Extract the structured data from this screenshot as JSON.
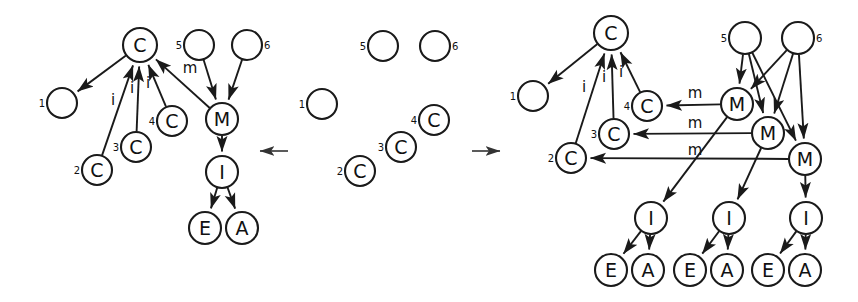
{
  "figure": {
    "background": "#ffffff",
    "stroke_color": "#1a1a1a",
    "width": 858,
    "height": 302
  },
  "transitions": [
    {
      "name": "left-transition-arrow",
      "glyph": "←",
      "direction": "left",
      "x": 274,
      "y": 151
    },
    {
      "name": "right-transition-arrow",
      "glyph": "→",
      "direction": "right",
      "x": 486,
      "y": 151
    }
  ],
  "panels": [
    {
      "id": "left-panel",
      "name": "left-graph",
      "nodes": [
        {
          "id": "L-C0",
          "label": "C",
          "index": "",
          "x": 140,
          "y": 45,
          "r": 17,
          "index_side": "none"
        },
        {
          "id": "L-1",
          "label": "",
          "index": "1",
          "x": 62,
          "y": 103,
          "r": 15,
          "index_side": "left"
        },
        {
          "id": "L-2",
          "label": "C",
          "index": "2",
          "x": 97,
          "y": 170,
          "r": 15,
          "index_side": "left"
        },
        {
          "id": "L-3",
          "label": "C",
          "index": "3",
          "x": 136,
          "y": 147,
          "r": 15,
          "index_side": "left"
        },
        {
          "id": "L-4",
          "label": "C",
          "index": "4",
          "x": 172,
          "y": 121,
          "r": 15,
          "index_side": "left"
        },
        {
          "id": "L-5",
          "label": "",
          "index": "5",
          "x": 199,
          "y": 45,
          "r": 15,
          "index_side": "left"
        },
        {
          "id": "L-6",
          "label": "",
          "index": "6",
          "x": 247,
          "y": 45,
          "r": 15,
          "index_side": "right"
        },
        {
          "id": "L-M",
          "label": "M",
          "index": "",
          "x": 222,
          "y": 119,
          "r": 16,
          "index_side": "none"
        },
        {
          "id": "L-I",
          "label": "I",
          "index": "",
          "x": 222,
          "y": 172,
          "r": 16,
          "index_side": "none"
        },
        {
          "id": "L-E",
          "label": "E",
          "index": "",
          "x": 205,
          "y": 228,
          "r": 16,
          "index_side": "none"
        },
        {
          "id": "L-A",
          "label": "A",
          "index": "",
          "x": 242,
          "y": 228,
          "r": 16,
          "index_side": "none"
        }
      ],
      "edges": [
        {
          "from": "L-C0",
          "to": "L-1",
          "label": "",
          "lx": 0,
          "ly": 0
        },
        {
          "from": "L-2",
          "to": "L-C0",
          "label": "i",
          "lx": 113,
          "ly": 105
        },
        {
          "from": "L-3",
          "to": "L-C0",
          "label": "i",
          "lx": 132,
          "ly": 93
        },
        {
          "from": "L-4",
          "to": "L-C0",
          "label": "i",
          "lx": 148,
          "ly": 88
        },
        {
          "from": "L-M",
          "to": "L-C0",
          "label": "m",
          "lx": 190,
          "ly": 73
        },
        {
          "from": "L-5",
          "to": "L-M",
          "label": "",
          "lx": 0,
          "ly": 0
        },
        {
          "from": "L-6",
          "to": "L-M",
          "label": "",
          "lx": 0,
          "ly": 0
        },
        {
          "from": "L-M",
          "to": "L-I",
          "label": "",
          "lx": 0,
          "ly": 0
        },
        {
          "from": "L-I",
          "to": "L-E",
          "label": "",
          "lx": 0,
          "ly": 0
        },
        {
          "from": "L-I",
          "to": "L-A",
          "label": "",
          "lx": 0,
          "ly": 0
        }
      ]
    },
    {
      "id": "middle-panel",
      "name": "middle-graph",
      "nodes": [
        {
          "id": "M-1",
          "label": "",
          "index": "1",
          "x": 322,
          "y": 104,
          "r": 15,
          "index_side": "left"
        },
        {
          "id": "M-2",
          "label": "C",
          "index": "2",
          "x": 360,
          "y": 171,
          "r": 15,
          "index_side": "left"
        },
        {
          "id": "M-3",
          "label": "C",
          "index": "3",
          "x": 401,
          "y": 147,
          "r": 15,
          "index_side": "left"
        },
        {
          "id": "M-4",
          "label": "C",
          "index": "4",
          "x": 434,
          "y": 120,
          "r": 15,
          "index_side": "left"
        },
        {
          "id": "M-5",
          "label": "",
          "index": "5",
          "x": 383,
          "y": 46,
          "r": 15,
          "index_side": "left"
        },
        {
          "id": "M-6",
          "label": "",
          "index": "6",
          "x": 435,
          "y": 46,
          "r": 15,
          "index_side": "right"
        }
      ],
      "edges": []
    },
    {
      "id": "right-panel",
      "name": "right-graph",
      "nodes": [
        {
          "id": "R-C0",
          "label": "C",
          "index": "",
          "x": 611,
          "y": 33,
          "r": 17,
          "index_side": "none"
        },
        {
          "id": "R-1",
          "label": "",
          "index": "1",
          "x": 533,
          "y": 96,
          "r": 15,
          "index_side": "left"
        },
        {
          "id": "R-2",
          "label": "C",
          "index": "2",
          "x": 571,
          "y": 158,
          "r": 15,
          "index_side": "left"
        },
        {
          "id": "R-3",
          "label": "C",
          "index": "3",
          "x": 614,
          "y": 134,
          "r": 15,
          "index_side": "left"
        },
        {
          "id": "R-4",
          "label": "C",
          "index": "4",
          "x": 647,
          "y": 106,
          "r": 15,
          "index_side": "left"
        },
        {
          "id": "R-5",
          "label": "",
          "index": "5",
          "x": 745,
          "y": 38,
          "r": 16,
          "index_side": "left"
        },
        {
          "id": "R-6",
          "label": "",
          "index": "6",
          "x": 798,
          "y": 38,
          "r": 16,
          "index_side": "right"
        },
        {
          "id": "R-M1",
          "label": "M",
          "index": "",
          "x": 737,
          "y": 104,
          "r": 16,
          "index_side": "none"
        },
        {
          "id": "R-M2",
          "label": "M",
          "index": "",
          "x": 768,
          "y": 133,
          "r": 16,
          "index_side": "none"
        },
        {
          "id": "R-M3",
          "label": "M",
          "index": "",
          "x": 805,
          "y": 159,
          "r": 16,
          "index_side": "none"
        },
        {
          "id": "R-I1",
          "label": "I",
          "index": "",
          "x": 651,
          "y": 218,
          "r": 16,
          "index_side": "none"
        },
        {
          "id": "R-I2",
          "label": "I",
          "index": "",
          "x": 729,
          "y": 218,
          "r": 16,
          "index_side": "none"
        },
        {
          "id": "R-I3",
          "label": "I",
          "index": "",
          "x": 806,
          "y": 218,
          "r": 16,
          "index_side": "none"
        },
        {
          "id": "R-E1",
          "label": "E",
          "index": "",
          "x": 611,
          "y": 270,
          "r": 16,
          "index_side": "none"
        },
        {
          "id": "R-A1",
          "label": "A",
          "index": "",
          "x": 648,
          "y": 270,
          "r": 16,
          "index_side": "none"
        },
        {
          "id": "R-E2",
          "label": "E",
          "index": "",
          "x": 690,
          "y": 270,
          "r": 16,
          "index_side": "none"
        },
        {
          "id": "R-A2",
          "label": "A",
          "index": "",
          "x": 727,
          "y": 270,
          "r": 16,
          "index_side": "none"
        },
        {
          "id": "R-E3",
          "label": "E",
          "index": "",
          "x": 768,
          "y": 270,
          "r": 16,
          "index_side": "none"
        },
        {
          "id": "R-A3",
          "label": "A",
          "index": "",
          "x": 805,
          "y": 270,
          "r": 16,
          "index_side": "none"
        }
      ],
      "edges": [
        {
          "from": "R-C0",
          "to": "R-1",
          "label": "",
          "lx": 0,
          "ly": 0
        },
        {
          "from": "R-2",
          "to": "R-C0",
          "label": "i",
          "lx": 584,
          "ly": 92
        },
        {
          "from": "R-3",
          "to": "R-C0",
          "label": "i",
          "lx": 604,
          "ly": 82
        },
        {
          "from": "R-4",
          "to": "R-C0",
          "label": "i",
          "lx": 621,
          "ly": 77
        },
        {
          "from": "R-M1",
          "to": "R-4",
          "label": "m",
          "lx": 695,
          "ly": 98
        },
        {
          "from": "R-M2",
          "to": "R-3",
          "label": "m",
          "lx": 695,
          "ly": 128
        },
        {
          "from": "R-M3",
          "to": "R-2",
          "label": "m",
          "lx": 695,
          "ly": 155
        },
        {
          "from": "R-5",
          "to": "R-M1",
          "label": "",
          "lx": 0,
          "ly": 0
        },
        {
          "from": "R-5",
          "to": "R-M2",
          "label": "",
          "lx": 0,
          "ly": 0
        },
        {
          "from": "R-5",
          "to": "R-M3",
          "label": "",
          "lx": 0,
          "ly": 0
        },
        {
          "from": "R-6",
          "to": "R-M1",
          "label": "",
          "lx": 0,
          "ly": 0
        },
        {
          "from": "R-6",
          "to": "R-M2",
          "label": "",
          "lx": 0,
          "ly": 0
        },
        {
          "from": "R-6",
          "to": "R-M3",
          "label": "",
          "lx": 0,
          "ly": 0
        },
        {
          "from": "R-M1",
          "to": "R-I1",
          "label": "",
          "lx": 0,
          "ly": 0
        },
        {
          "from": "R-M2",
          "to": "R-I2",
          "label": "",
          "lx": 0,
          "ly": 0
        },
        {
          "from": "R-M3",
          "to": "R-I3",
          "label": "",
          "lx": 0,
          "ly": 0
        },
        {
          "from": "R-I1",
          "to": "R-E1",
          "label": "",
          "lx": 0,
          "ly": 0
        },
        {
          "from": "R-I1",
          "to": "R-A1",
          "label": "",
          "lx": 0,
          "ly": 0
        },
        {
          "from": "R-I2",
          "to": "R-E2",
          "label": "",
          "lx": 0,
          "ly": 0
        },
        {
          "from": "R-I2",
          "to": "R-A2",
          "label": "",
          "lx": 0,
          "ly": 0
        },
        {
          "from": "R-I3",
          "to": "R-E3",
          "label": "",
          "lx": 0,
          "ly": 0
        },
        {
          "from": "R-I3",
          "to": "R-A3",
          "label": "",
          "lx": 0,
          "ly": 0
        }
      ]
    }
  ]
}
